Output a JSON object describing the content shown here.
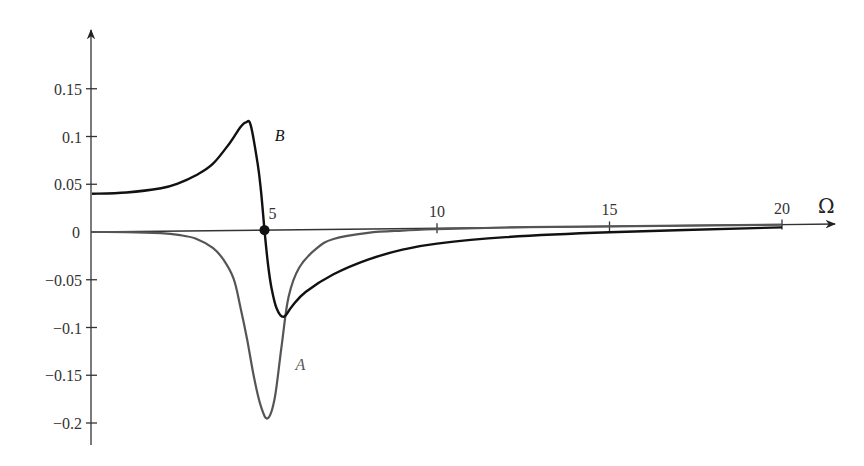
{
  "chart_data": {
    "type": "line",
    "title": "",
    "xlabel": "Ω",
    "ylabel": "",
    "xlim": [
      0,
      20.9
    ],
    "ylim": [
      -0.22,
      0.2
    ],
    "grid": false,
    "legend": "none (curves labeled inline)",
    "x_ticks": [
      5,
      10,
      15,
      20
    ],
    "x_tick_labels": [
      "5",
      "10",
      "15",
      "20"
    ],
    "y_ticks": [
      0.15,
      0.1,
      0.05,
      0,
      -0.05,
      -0.1,
      -0.15,
      -0.2
    ],
    "y_tick_labels": [
      "0.15",
      "0.1",
      "0.05",
      "0",
      "−0.05",
      "−0.1",
      "−0.15",
      "−0.2"
    ],
    "series": [
      {
        "name": "A",
        "color": "#555555",
        "x": [
          0,
          1,
          2,
          2.5,
          3,
          3.5,
          3.8,
          4.1,
          4.3,
          4.5,
          4.7,
          4.9,
          5.1,
          5.3,
          5.5,
          5.7,
          6,
          6.5,
          7,
          8,
          9,
          10,
          12,
          15,
          20
        ],
        "values": [
          0,
          -0.0005,
          -0.002,
          -0.004,
          -0.008,
          -0.018,
          -0.03,
          -0.05,
          -0.08,
          -0.115,
          -0.155,
          -0.185,
          -0.197,
          -0.175,
          -0.12,
          -0.07,
          -0.04,
          -0.02,
          -0.01,
          -0.004,
          -0.002,
          -0.001,
          0,
          0,
          0
        ]
      },
      {
        "name": "B",
        "color": "#111111",
        "x": [
          0,
          1,
          2,
          2.5,
          3,
          3.5,
          4,
          4.3,
          4.46,
          4.6,
          4.8,
          4.9,
          5,
          5.1,
          5.2,
          5.35,
          5.55,
          5.8,
          6.2,
          7,
          8,
          9,
          10,
          12,
          15,
          20
        ],
        "values": [
          0.04,
          0.041,
          0.045,
          0.05,
          0.058,
          0.07,
          0.092,
          0.108,
          0.113,
          0.11,
          0.07,
          0.04,
          0,
          -0.035,
          -0.06,
          -0.082,
          -0.091,
          -0.08,
          -0.065,
          -0.047,
          -0.032,
          -0.022,
          -0.016,
          -0.01,
          -0.006,
          -0.003
        ]
      }
    ],
    "annotations": [
      {
        "text": "B",
        "x": 5.3,
        "y": 0.1,
        "series": "B"
      },
      {
        "text": "A",
        "x": 5.9,
        "y": -0.14,
        "series": "A"
      },
      {
        "text": "5",
        "type": "marker",
        "x": 5,
        "y": 0,
        "shape": "filled-circle"
      }
    ]
  }
}
